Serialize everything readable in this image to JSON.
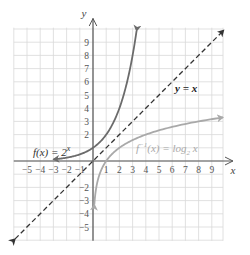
{
  "chart_data": {
    "type": "line",
    "title": "",
    "xlabel": "x",
    "ylabel": "y",
    "xlim": [
      -6,
      10
    ],
    "ylim": [
      -6,
      10
    ],
    "grid": true,
    "x_ticks": [
      "−5",
      "−4",
      "−3",
      "−2",
      "−1",
      "1",
      "2",
      "3",
      "4",
      "5",
      "6",
      "7",
      "8",
      "9"
    ],
    "y_ticks": [
      "9",
      "8",
      "7",
      "6",
      "5",
      "4",
      "3",
      "2",
      "−2",
      "−3",
      "−4",
      "−5"
    ],
    "series": [
      {
        "name": "f(x) = 2^x",
        "label": "f(x) = 2",
        "label_sup": "x",
        "color": "#6b6b6b",
        "style": "solid",
        "x": [
          -3,
          -2,
          -1,
          0,
          1,
          2,
          3,
          3.3
        ],
        "y": [
          0.125,
          0.25,
          0.5,
          1,
          2,
          4,
          8,
          9.85
        ]
      },
      {
        "name": "y = x",
        "label": "y = x",
        "color": "#333333",
        "style": "dashed",
        "x": [
          -6,
          10
        ],
        "y": [
          -6,
          10
        ]
      },
      {
        "name": "f^-1(x) = log2 x",
        "label_pre": "f",
        "label_sup": "−1",
        "label_mid": "(x) = log",
        "label_sub": "2",
        "label_post": " x",
        "color": "#a9a9a9",
        "style": "solid",
        "x": [
          0.1,
          0.125,
          0.25,
          0.5,
          1,
          2,
          4,
          8,
          10
        ],
        "y": [
          -3.3,
          -3,
          -2,
          -1,
          0,
          1,
          2,
          3,
          3.32
        ]
      }
    ]
  }
}
